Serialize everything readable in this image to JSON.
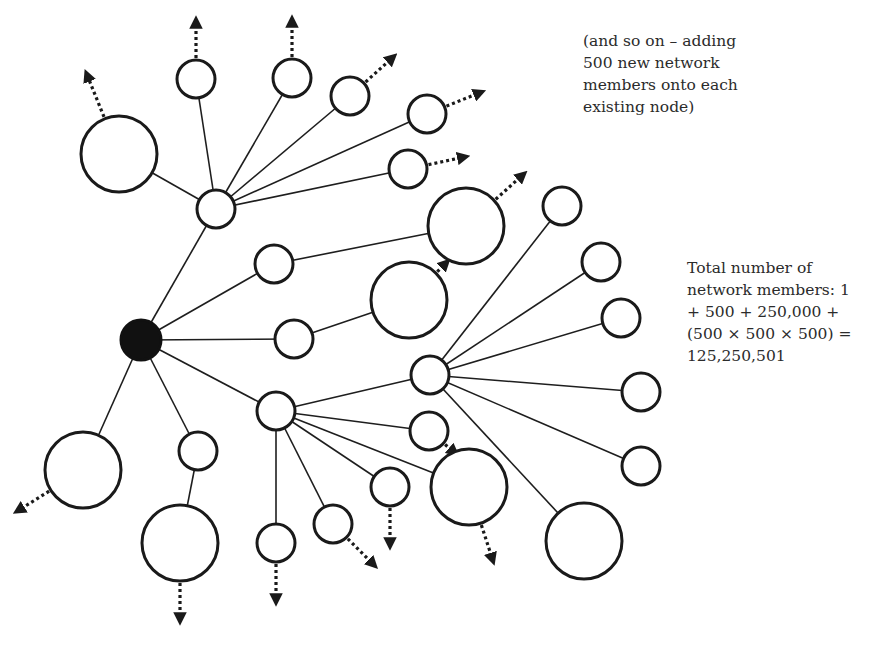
{
  "diagram": {
    "node_style": {
      "stroke": "#1a1a1a",
      "fill": "#ffffff",
      "root_fill": "#111111"
    },
    "nodes": [
      {
        "id": "root",
        "size": "root",
        "parent": null
      },
      {
        "id": "L1a",
        "size": "small",
        "parent": "root"
      },
      {
        "id": "L1b",
        "size": "small",
        "parent": "root"
      },
      {
        "id": "L1c",
        "size": "small",
        "parent": "root"
      },
      {
        "id": "L1d",
        "size": "small",
        "parent": "root"
      },
      {
        "id": "L1e",
        "size": "large",
        "parent": "root"
      },
      {
        "id": "L1f",
        "size": "small",
        "parent": "root"
      },
      {
        "id": "A1",
        "size": "large",
        "parent": "L1a",
        "continues": true
      },
      {
        "id": "A2",
        "size": "small",
        "parent": "L1a",
        "continues": true
      },
      {
        "id": "A3",
        "size": "small",
        "parent": "L1a",
        "continues": true
      },
      {
        "id": "A4",
        "size": "small",
        "parent": "L1a",
        "continues": true
      },
      {
        "id": "A5",
        "size": "small",
        "parent": "L1a",
        "continues": true
      },
      {
        "id": "A6",
        "size": "small",
        "parent": "L1a",
        "continues": true
      },
      {
        "id": "B1",
        "size": "large",
        "parent": "L1b",
        "continues": true
      },
      {
        "id": "C1",
        "size": "large",
        "parent": "L1c",
        "continues": true
      },
      {
        "id": "D1",
        "size": "small",
        "parent": "L1d"
      },
      {
        "id": "D2",
        "size": "small",
        "parent": "L1d",
        "continues": true
      },
      {
        "id": "D3",
        "size": "large",
        "parent": "L1d",
        "continues": true
      },
      {
        "id": "D4",
        "size": "small",
        "parent": "L1d",
        "continues": true
      },
      {
        "id": "D5",
        "size": "small",
        "parent": "L1d",
        "continues": true
      },
      {
        "id": "D6",
        "size": "small",
        "parent": "L1d",
        "continues": true
      },
      {
        "id": "E1",
        "size": "small",
        "parent": "D1"
      },
      {
        "id": "E2",
        "size": "small",
        "parent": "D1"
      },
      {
        "id": "E3",
        "size": "small",
        "parent": "D1"
      },
      {
        "id": "E4",
        "size": "small",
        "parent": "D1"
      },
      {
        "id": "E5",
        "size": "small",
        "parent": "D1"
      },
      {
        "id": "E6",
        "size": "large",
        "parent": "D1"
      },
      {
        "id": "F1",
        "size": "large",
        "parent": "L1f",
        "continues": true
      }
    ]
  },
  "annotations": {
    "continuation_note": "(and so on – adding\n500 new network\nmembers onto each\nexisting node)",
    "total_note": "Total number of\nnetwork members: 1\n+ 500 + 250,000 +\n(500 × 500 × 500) =\n125,250,501"
  }
}
